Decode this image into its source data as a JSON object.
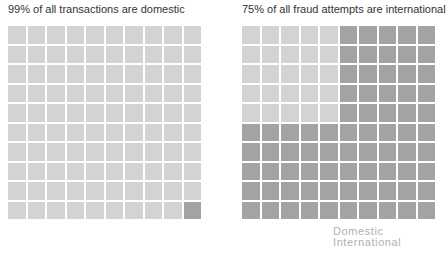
{
  "chart_data": [
    {
      "type": "waffle",
      "title": "99% of all transactions are domestic",
      "grid": [
        10,
        10
      ],
      "categories": [
        "Domestic",
        "International"
      ],
      "values": [
        99,
        1
      ],
      "colors": {
        "Domestic": "#d3d3d3",
        "International": "#a3a3a3"
      },
      "cells": "Row-major fill; all cells Domestic except the bottom-right cell which is International"
    },
    {
      "type": "waffle",
      "title": "75% of all fraud attempts are international",
      "grid": [
        10,
        10
      ],
      "categories": [
        "Domestic",
        "International"
      ],
      "values": [
        25,
        75
      ],
      "colors": {
        "Domestic": "#d3d3d3",
        "International": "#a3a3a3"
      },
      "cells": "Domestic occupies top-left 5x5 block; remaining 75 cells International"
    }
  ],
  "charts": {
    "left": {
      "title": "99% of all transactions are domestic"
    },
    "right": {
      "title": "75% of all fraud attempts are international"
    }
  },
  "legend": {
    "items": [
      {
        "label": "Domestic",
        "color": "#d3d3d3"
      },
      {
        "label": "International",
        "color": "#a3a3a3"
      }
    ]
  }
}
